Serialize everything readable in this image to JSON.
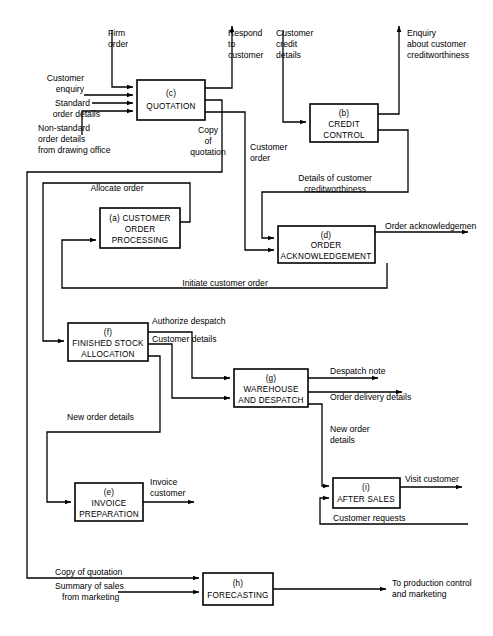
{
  "diagram": {
    "type": "data-flow-diagram",
    "background_color": "#ffffff",
    "line_color": "#000000",
    "box_fill": "#ffffff"
  },
  "processes": [
    {
      "id": "(a)",
      "name": "CUSTOMER ORDER PROCESSING",
      "lines": [
        "(a)   CUSTOMER",
        "ORDER",
        "PROCESSING"
      ],
      "x": 100,
      "y": 208,
      "w": 80,
      "h": 40
    },
    {
      "id": "(b)",
      "name": "CREDIT CONTROL",
      "lines": [
        "(b)",
        "CREDIT",
        "CONTROL"
      ],
      "x": 310,
      "y": 104,
      "w": 68,
      "h": 38
    },
    {
      "id": "(c)",
      "name": "QUOTATION",
      "lines": [
        "(c)",
        "QUOTATION"
      ],
      "x": 137,
      "y": 80,
      "w": 68,
      "h": 40
    },
    {
      "id": "(d)",
      "name": "ORDER ACKNOWLEDGEMENT",
      "lines": [
        "(d)",
        "ORDER",
        "ACKNOWLEDGEMENT"
      ],
      "x": 278,
      "y": 226,
      "w": 97,
      "h": 37
    },
    {
      "id": "(e)",
      "name": "INVOICE PREPARATION",
      "lines": [
        "(e)",
        "INVOICE",
        "PREPARATION"
      ],
      "x": 75,
      "y": 483,
      "w": 68,
      "h": 38
    },
    {
      "id": "(f)",
      "name": "FINISHED STOCK ALLOCATION",
      "lines": [
        "(f)",
        "FINISHED STOCK",
        "ALLOCATION"
      ],
      "x": 68,
      "y": 323,
      "w": 80,
      "h": 38
    },
    {
      "id": "(g)",
      "name": "WAREHOUSE AND DESPATCH",
      "lines": [
        "(g)",
        "WAREHOUSE",
        "AND DESPATCH"
      ],
      "x": 234,
      "y": 369,
      "w": 74,
      "h": 38
    },
    {
      "id": "(h)",
      "name": "FORECASTING",
      "lines": [
        "(h)",
        "FORECASTING"
      ],
      "x": 203,
      "y": 573,
      "w": 70,
      "h": 32
    },
    {
      "id": "(i)",
      "name": "AFTER SALES",
      "lines": [
        "(i)",
        "AFTER SALES"
      ],
      "x": 333,
      "y": 478,
      "w": 67,
      "h": 30
    }
  ],
  "flows": [
    {
      "label": "Firm order",
      "lines": [
        "Firm",
        "order"
      ],
      "from": "external",
      "to": "(c)"
    },
    {
      "label": "Customer enquiry",
      "lines": [
        "Customer",
        "enquiry"
      ],
      "from": "external",
      "to": "(c)"
    },
    {
      "label": "Standard order details",
      "lines": [
        "Standard",
        "order details"
      ],
      "from": "external",
      "to": "(c)"
    },
    {
      "label": "Non-standard order details from drawing office",
      "lines": [
        "Non-standard",
        "order details",
        "from drawing office"
      ],
      "from": "external",
      "to": "(c)"
    },
    {
      "label": "Respond to customer",
      "lines": [
        "Respond",
        "to",
        "customer"
      ],
      "from": "(c)",
      "to": "external"
    },
    {
      "label": "Copy of quotation",
      "lines": [
        "Copy",
        "of",
        "quotation"
      ],
      "from": "(c)",
      "to": "(h)"
    },
    {
      "label": "Customer order",
      "lines": [
        "Customer",
        "order"
      ],
      "from": "(c)",
      "to": "(d)"
    },
    {
      "label": "Customer credit details",
      "lines": [
        "Customer",
        "credit",
        "details"
      ],
      "from": "external",
      "to": "(b)"
    },
    {
      "label": "Enquiry about customer creditworthiness",
      "lines": [
        "Enquiry",
        "about customer",
        "creditworthiness"
      ],
      "from": "(b)",
      "to": "external"
    },
    {
      "label": "Details of customer creditworthiness",
      "lines": [
        "Details of customer",
        "creditworthiness"
      ],
      "from": "(b)",
      "to": "(d)"
    },
    {
      "label": "Allocate order",
      "lines": [
        "Allocate order"
      ],
      "from": "(a)",
      "to": "(f)"
    },
    {
      "label": "Initiate customer order",
      "lines": [
        "Initiate customer order"
      ],
      "from": "(d)",
      "to": "(a)"
    },
    {
      "label": "Order acknowledgemen",
      "lines": [
        "Order acknowledgemen"
      ],
      "from": "(d)",
      "to": "external"
    },
    {
      "label": "Authorize despatch",
      "lines": [
        "Authorize despatch"
      ],
      "from": "(f)",
      "to": "(g)"
    },
    {
      "label": "Customer details",
      "lines": [
        "Customer details"
      ],
      "from": "(f)",
      "to": "(g)"
    },
    {
      "label": "New order details",
      "lines": [
        "New order details"
      ],
      "from": "(f)",
      "to": "(e)"
    },
    {
      "label": "Despatch note",
      "lines": [
        "Despatch note"
      ],
      "from": "(g)",
      "to": "external"
    },
    {
      "label": "Order delivery details",
      "lines": [
        "Order delivery details"
      ],
      "from": "(g)",
      "to": "external"
    },
    {
      "label": "New order details",
      "lines": [
        "New order",
        "details"
      ],
      "from": "(g)",
      "to": "(i)"
    },
    {
      "label": "Invoice customer",
      "lines": [
        "Invoice",
        "customer"
      ],
      "from": "(e)",
      "to": "external"
    },
    {
      "label": "Visit customer",
      "lines": [
        "Visit customer"
      ],
      "from": "(i)",
      "to": "external"
    },
    {
      "label": "Customer requests",
      "lines": [
        "Customer requests"
      ],
      "from": "external",
      "to": "(i)"
    },
    {
      "label": "Copy of quotation",
      "lines": [
        "Copy of quotation"
      ],
      "from": "(c)",
      "to": "(h)"
    },
    {
      "label": "Summary of sales from marketing",
      "lines": [
        "Summary of sales",
        "from marketing"
      ],
      "from": "external",
      "to": "(h)"
    },
    {
      "label": "To production control and marketing",
      "lines": [
        "To production control",
        "and marketing"
      ],
      "from": "(h)",
      "to": "external"
    }
  ],
  "labels": {
    "firm_order_1": "Firm",
    "firm_order_2": "order",
    "customer_enquiry_1": "Customer",
    "customer_enquiry_2": "enquiry",
    "standard_order_1": "Standard",
    "standard_order_2": "order details",
    "nonstandard_1": "Non-standard",
    "nonstandard_2": "order details",
    "nonstandard_3": "from drawing office",
    "respond_1": "Respond",
    "respond_2": "to",
    "respond_3": "customer",
    "copyquote_1": "Copy",
    "copyquote_2": "of",
    "copyquote_3": "quotation",
    "custorder_1": "Customer",
    "custorder_2": "order",
    "custcredit_1": "Customer",
    "custcredit_2": "credit",
    "custcredit_3": "details",
    "enquiry_1": "Enquiry",
    "enquiry_2": "about customer",
    "enquiry_3": "creditworthiness",
    "details_cw_1": "Details of customer",
    "details_cw_2": "creditworthiness",
    "allocate_order": "Allocate order",
    "initiate_order": "Initiate customer order",
    "order_ack": "Order acknowledgemen",
    "authorize_despatch": "Authorize despatch",
    "customer_details": "Customer details",
    "new_order_details_f": "New order details",
    "despatch_note": "Despatch note",
    "order_delivery": "Order delivery details",
    "new_order_1": "New order",
    "new_order_2": "details",
    "invoice_1": "Invoice",
    "invoice_2": "customer",
    "visit_customer": "Visit customer",
    "customer_requests": "Customer requests",
    "copy_quotation_h": "Copy of quotation",
    "summary_1": "Summary of sales",
    "summary_2": "from marketing",
    "to_production_1": "To production control",
    "to_production_2": "and marketing"
  },
  "process_text": {
    "a_1": "(a)   CUSTOMER",
    "a_2": "ORDER",
    "a_3": "PROCESSING",
    "b_1": "(b)",
    "b_2": "CREDIT",
    "b_3": "CONTROL",
    "c_1": "(c)",
    "c_2": "QUOTATION",
    "d_1": "(d)",
    "d_2": "ORDER",
    "d_3": "ACKNOWLEDGEMENT",
    "e_1": "(e)",
    "e_2": "INVOICE",
    "e_3": "PREPARATION",
    "f_1": "(f)",
    "f_2": "FINISHED STOCK",
    "f_3": "ALLOCATION",
    "g_1": "(g)",
    "g_2": "WAREHOUSE",
    "g_3": "AND DESPATCH",
    "h_1": "(h)",
    "h_2": "FORECASTING",
    "i_1": "(i)",
    "i_2": "AFTER SALES"
  }
}
